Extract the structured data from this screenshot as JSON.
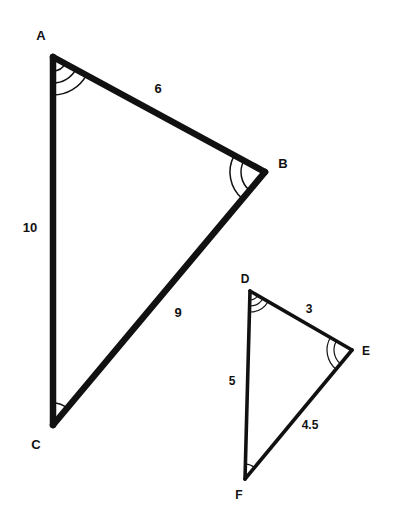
{
  "figure": {
    "background_color": "#ffffff",
    "stroke_color": "#111111"
  },
  "triangle_large": {
    "name": "Triangle ABC",
    "vertices": [
      {
        "id": "A",
        "label": "A",
        "x": 53,
        "y": 57,
        "label_x": 41,
        "label_y": 40,
        "arc_count": 3
      },
      {
        "id": "B",
        "label": "B",
        "x": 265,
        "y": 172,
        "label_x": 283,
        "label_y": 168,
        "arc_count": 2
      },
      {
        "id": "C",
        "label": "C",
        "x": 53,
        "y": 425,
        "label_x": 36,
        "label_y": 449,
        "arc_count": 1
      }
    ],
    "sides": [
      {
        "id": "AB",
        "label": "6",
        "value": 6,
        "label_x": 158,
        "label_y": 93
      },
      {
        "id": "AC",
        "label": "10",
        "value": 10,
        "label_x": 30,
        "label_y": 232
      },
      {
        "id": "BC",
        "label": "9",
        "value": 9,
        "label_x": 178,
        "label_y": 317
      }
    ]
  },
  "triangle_small": {
    "name": "Triangle DEF",
    "vertices": [
      {
        "id": "D",
        "label": "D",
        "x": 250,
        "y": 291,
        "label_x": 245,
        "label_y": 283,
        "arc_count": 3
      },
      {
        "id": "E",
        "label": "E",
        "x": 352,
        "y": 350,
        "label_x": 366,
        "label_y": 355,
        "arc_count": 2
      },
      {
        "id": "F",
        "label": "F",
        "x": 245,
        "y": 479,
        "label_x": 239,
        "label_y": 499,
        "arc_count": 1
      }
    ],
    "sides": [
      {
        "id": "DE",
        "label": "3",
        "value": 3,
        "label_x": 309,
        "label_y": 313
      },
      {
        "id": "DF",
        "label": "5",
        "value": 5,
        "label_x": 232,
        "label_y": 385
      },
      {
        "id": "EF",
        "label": "4.5",
        "value": 4.5,
        "label_x": 310,
        "label_y": 429
      }
    ]
  }
}
